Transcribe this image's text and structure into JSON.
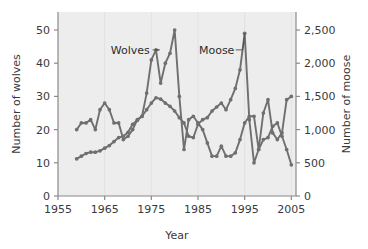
{
  "chart_data": {
    "type": "line",
    "title": "",
    "subtitle": "",
    "xlabel": "Year",
    "ylabel": "Number of wolves",
    "y2label": "Number of moose",
    "xlim": [
      1955,
      2006
    ],
    "ylim": [
      0,
      52
    ],
    "y2lim": [
      0,
      2600
    ],
    "xticks": [
      1955,
      1965,
      1975,
      1985,
      1995,
      2005
    ],
    "xticklabels": [
      "1955",
      "1965",
      "1975",
      "1985",
      "1995",
      "2005"
    ],
    "yticks": [
      0,
      10,
      20,
      30,
      40,
      50
    ],
    "yticklabels": [
      "0",
      "10",
      "20",
      "30",
      "40",
      "50"
    ],
    "y2ticks": [
      0,
      500,
      1000,
      1500,
      2000,
      2500
    ],
    "y2ticklabels": [
      "0",
      "500",
      "1,000",
      "1,500",
      "2,000",
      "2,500"
    ],
    "grid": "vertical-faint",
    "legend_position": "inline-annotations",
    "line_color": "#6f6f6f",
    "marker": "circle",
    "plot_background": "#ededed",
    "page_background": "#ffffff",
    "annotations": [
      {
        "text": "Wolves",
        "x": 1970.5,
        "y": 44.0,
        "points_to_x": 1976.0,
        "points_to_y": 44.0
      },
      {
        "text": "Moose",
        "x": 1989.0,
        "y": 44.0,
        "points_to_x": 1995.0,
        "points_to_y": 2450.0
      }
    ],
    "series": [
      {
        "name": "Wolves",
        "axis": "left",
        "x": [
          1959,
          1960,
          1961,
          1962,
          1963,
          1964,
          1965,
          1966,
          1967,
          1968,
          1969,
          1970,
          1971,
          1972,
          1973,
          1974,
          1975,
          1976,
          1977,
          1978,
          1979,
          1980,
          1981,
          1982,
          1983,
          1984,
          1985,
          1986,
          1987,
          1988,
          1989,
          1990,
          1991,
          1992,
          1993,
          1994,
          1995,
          1996,
          1997,
          1998,
          1999,
          2000,
          2001,
          2002,
          2003,
          2004,
          2005
        ],
        "values": [
          20,
          22,
          22,
          23,
          20,
          26,
          28,
          26,
          22,
          22,
          17,
          18,
          20,
          23,
          24,
          31,
          41,
          44,
          34,
          40,
          43,
          50,
          30,
          14,
          23,
          24,
          22,
          20,
          16,
          12,
          12,
          15,
          12,
          12,
          13,
          17,
          22,
          24,
          24,
          14,
          25,
          29,
          19,
          17,
          19,
          29,
          30
        ]
      },
      {
        "name": "Moose",
        "axis": "right",
        "x": [
          1959,
          1960,
          1961,
          1962,
          1963,
          1964,
          1965,
          1966,
          1967,
          1968,
          1969,
          1970,
          1971,
          1972,
          1973,
          1974,
          1975,
          1976,
          1977,
          1978,
          1979,
          1980,
          1981,
          1982,
          1983,
          1984,
          1985,
          1986,
          1987,
          1988,
          1989,
          1990,
          1991,
          1992,
          1993,
          1994,
          1995,
          1996,
          1997,
          1998,
          1999,
          2000,
          2001,
          2002,
          2003,
          2004,
          2005
        ],
        "values": [
          560,
          600,
          640,
          660,
          660,
          680,
          720,
          760,
          820,
          880,
          900,
          960,
          1080,
          1140,
          1200,
          1300,
          1400,
          1480,
          1460,
          1400,
          1350,
          1280,
          1180,
          1100,
          900,
          880,
          1080,
          1150,
          1180,
          1280,
          1340,
          1400,
          1300,
          1450,
          1620,
          1900,
          2450,
          1150,
          500,
          700,
          850,
          880,
          1050,
          1100,
          900,
          700,
          470
        ]
      }
    ]
  },
  "axes": {
    "left_title": "Number of wolves",
    "right_title": "Number of moose",
    "bottom_title": "Year"
  },
  "labels": {
    "wolves": "Wolves",
    "moose": "Moose"
  }
}
